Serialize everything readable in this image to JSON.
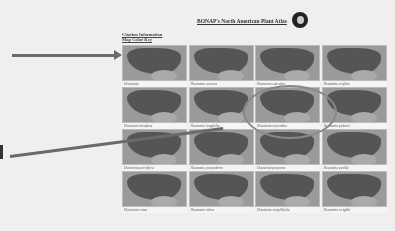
{
  "header": {
    "title": "BONAP's North American Plant Atlas",
    "logo_icon": "bonap-globe-logo"
  },
  "links": [
    {
      "label": "Citation Information"
    },
    {
      "label": "Map Color Key"
    }
  ],
  "maps": [
    {
      "label": "Houstonia"
    },
    {
      "label": "Houstonia acerosa"
    },
    {
      "label": "Houstonia caerulea"
    },
    {
      "label": "Houstonia croftiae"
    },
    {
      "label": "Houstonia humifusa"
    },
    {
      "label": "Houstonia longifolia"
    },
    {
      "label": "Houstonia micrantha"
    },
    {
      "label": "Houstonia palmeri"
    },
    {
      "label": "Houstonia parviflora"
    },
    {
      "label": "Houstonia procumbens"
    },
    {
      "label": "Houstonia purpurea"
    },
    {
      "label": "Houstonia pusilla"
    },
    {
      "label": "Houstonia rosea"
    },
    {
      "label": "Houstonia rubra"
    },
    {
      "label": "Houstonia serpyllifolia"
    },
    {
      "label": "Houstonia wrightii"
    }
  ],
  "annotations": {
    "arrow_1_target": "map-row-1",
    "arrow_2_target": "map-row-2",
    "highlight_circle_target": "map-row-2-col-3"
  }
}
